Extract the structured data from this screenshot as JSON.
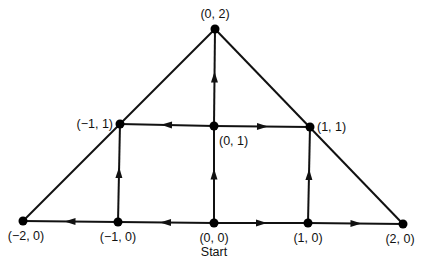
{
  "diagram": {
    "type": "directed-graph",
    "colors": {
      "ink": "#111111",
      "background": "#ffffff"
    },
    "nodes": [
      {
        "id": "n_0_2",
        "label": "(0, 2)",
        "x": 215,
        "y": 29,
        "lx": 215,
        "ly": 18,
        "anchor": "middle"
      },
      {
        "id": "n_m1_1",
        "label": "(−1, 1)",
        "x": 120,
        "y": 124,
        "lx": 113,
        "ly": 128,
        "anchor": "end"
      },
      {
        "id": "n_0_1",
        "label": "(0, 1)",
        "x": 214,
        "y": 126,
        "lx": 219,
        "ly": 145,
        "anchor": "start"
      },
      {
        "id": "n_1_1",
        "label": "(1, 1)",
        "x": 310,
        "y": 127,
        "lx": 317,
        "ly": 131,
        "anchor": "start"
      },
      {
        "id": "n_m2_0",
        "label": "(−2, 0)",
        "x": 23,
        "y": 221,
        "lx": 26,
        "ly": 240,
        "anchor": "middle"
      },
      {
        "id": "n_m1_0",
        "label": "(−1, 0)",
        "x": 118,
        "y": 222,
        "lx": 118,
        "ly": 241,
        "anchor": "middle"
      },
      {
        "id": "n_0_0",
        "label": "(0, 0)",
        "x": 214,
        "y": 223,
        "lx": 214,
        "ly": 242,
        "anchor": "middle"
      },
      {
        "id": "n_1_0",
        "label": "(1, 0)",
        "x": 308,
        "y": 223,
        "lx": 308,
        "ly": 242,
        "anchor": "middle"
      },
      {
        "id": "n_2_0",
        "label": "(2, 0)",
        "x": 403,
        "y": 224,
        "lx": 400,
        "ly": 243,
        "anchor": "middle"
      }
    ],
    "start_label": {
      "text": "Start",
      "x": 214,
      "y": 256
    },
    "edges": [
      {
        "from": "n_0_0",
        "to": "n_m1_0",
        "directed": true
      },
      {
        "from": "n_m1_0",
        "to": "n_m2_0",
        "directed": true
      },
      {
        "from": "n_0_0",
        "to": "n_1_0",
        "directed": true
      },
      {
        "from": "n_1_0",
        "to": "n_2_0",
        "directed": true
      },
      {
        "from": "n_m1_0",
        "to": "n_m1_1",
        "directed": true
      },
      {
        "from": "n_0_0",
        "to": "n_0_1",
        "directed": true
      },
      {
        "from": "n_1_0",
        "to": "n_1_1",
        "directed": true
      },
      {
        "from": "n_0_1",
        "to": "n_m1_1",
        "directed": true
      },
      {
        "from": "n_0_1",
        "to": "n_1_1",
        "directed": true
      },
      {
        "from": "n_0_1",
        "to": "n_0_2",
        "directed": true
      },
      {
        "from": "n_m2_0",
        "to": "n_0_2",
        "directed": false
      },
      {
        "from": "n_0_2",
        "to": "n_2_0",
        "directed": false
      }
    ]
  }
}
